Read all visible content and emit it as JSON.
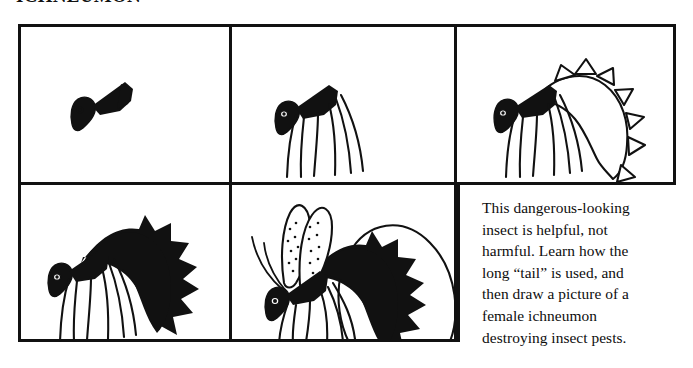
{
  "heading": {
    "text": "ICHNEUMON"
  },
  "grid": {
    "rows": 2,
    "columns": 3,
    "border_color": "#111111",
    "background_color": "#ffffff",
    "panels": [
      {
        "index": 1,
        "name": "panel-step-1",
        "content": "head-and-thorax",
        "type": "drawing"
      },
      {
        "index": 2,
        "name": "panel-step-2",
        "content": "legs-added",
        "type": "drawing"
      },
      {
        "index": 3,
        "name": "panel-step-3",
        "content": "abdomen-outline-added",
        "type": "drawing"
      },
      {
        "index": 4,
        "name": "panel-step-4",
        "content": "abdomen-filled-black",
        "type": "drawing"
      },
      {
        "index": 5,
        "name": "panel-step-5",
        "content": "wings-antennae-and-ovipositor-loop",
        "type": "drawing"
      },
      {
        "index": 6,
        "name": "panel-caption",
        "content": "instruction-text",
        "type": "text"
      }
    ]
  },
  "caption": {
    "full_text": "This dangerous-looking insect is helpful, not harmful. Learn how the long \"tail\" is used, and then draw a picture of a female ichneumon destroying insect pests.",
    "lines": [
      "This dangerous-looking",
      "insect is helpful, not",
      "harmful. Learn how the",
      "long “tail” is used, and",
      "then draw a picture of a",
      "female ichneumon",
      "destroying insect pests."
    ]
  },
  "illustration": {
    "subject": "female ichneumon wasp",
    "ink_color": "#111111",
    "paper_color": "#ffffff",
    "elements": [
      "head-with-eye",
      "thorax-wedge",
      "legs",
      "abdomen",
      "wings-with-speckles",
      "antennae",
      "ovipositor-tail-loop"
    ]
  }
}
